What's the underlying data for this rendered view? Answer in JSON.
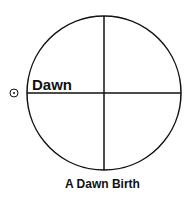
{
  "diagram": {
    "title": "A Dawn Birth",
    "horizon_label": "Dawn",
    "sun_symbol": "sun-icon",
    "line_color": "#111111"
  }
}
